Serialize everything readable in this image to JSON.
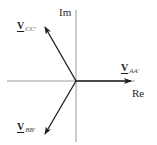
{
  "diagram": {
    "type": "phasor-diagram",
    "axes": {
      "imaginary_label": "Im",
      "real_label": "Re"
    },
    "phasors": [
      {
        "id": "AA",
        "symbol": "V",
        "subscript": "AA'",
        "direction": "along positive real axis (0°)"
      },
      {
        "id": "BB",
        "symbol": "V",
        "subscript": "BB'",
        "direction": "lower-left (about -120°)"
      },
      {
        "id": "CC",
        "symbol": "V",
        "subscript": "CC'",
        "direction": "upper-left (about 120°)"
      }
    ],
    "colors": {
      "background": "#ffffff",
      "axis": "#9a9a9a",
      "arrow": "#1e1e1e",
      "text": "#222222"
    }
  }
}
